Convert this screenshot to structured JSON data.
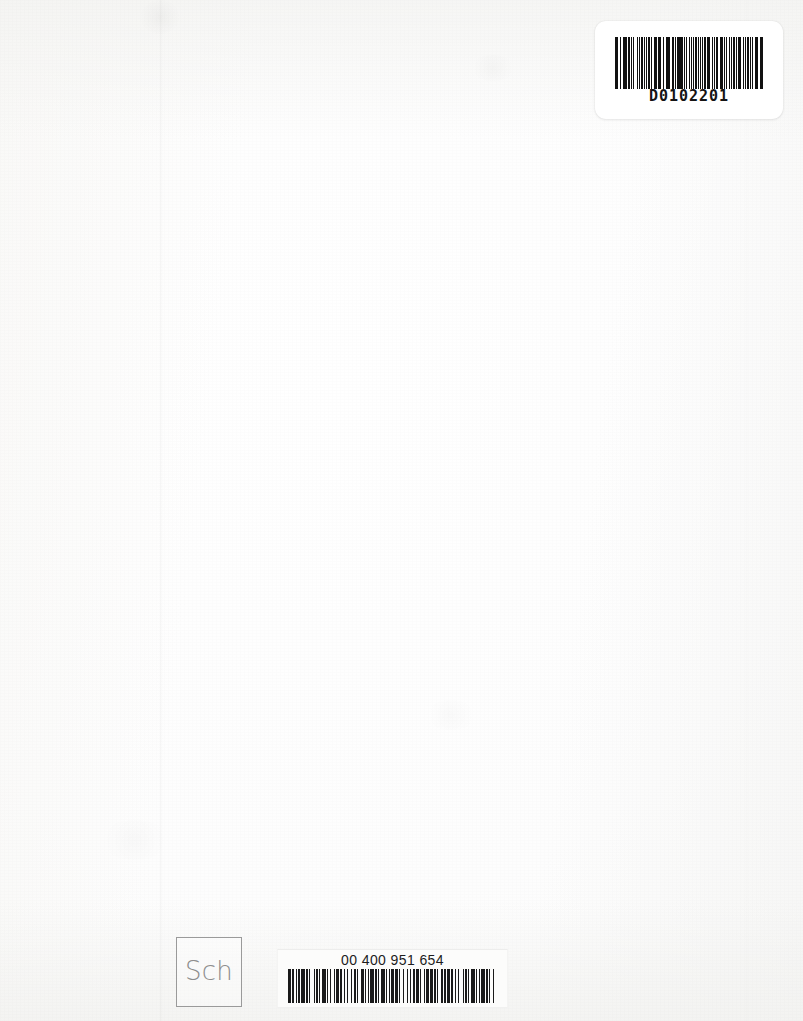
{
  "page": {
    "kind": "scanned-book-page",
    "width": 803,
    "height": 1021,
    "background_color": "#fdfdfc",
    "paper_tone": "#fafaf9"
  },
  "top_label": {
    "name": "accession-barcode-label",
    "code_text": "D0102201",
    "symbology": "code-39",
    "label_color": "#ffffff",
    "ink_color": "#111111",
    "bar_widths": [
      2,
      1,
      1,
      2,
      1,
      3,
      1,
      1,
      2,
      1,
      1,
      1,
      3,
      1,
      2,
      1,
      1,
      4,
      1,
      2,
      1,
      1,
      3,
      2,
      1,
      1,
      2,
      1,
      3,
      1,
      1,
      2,
      1,
      1,
      3,
      1,
      2,
      1,
      1,
      2,
      1,
      3,
      1,
      1,
      2,
      1,
      1,
      3,
      2,
      1,
      1,
      2,
      1,
      1,
      3,
      1,
      2,
      1,
      1,
      2,
      1,
      3,
      1,
      1,
      2,
      1,
      2,
      1,
      3,
      1,
      1,
      2,
      1,
      1,
      2,
      1,
      3,
      1,
      2,
      1,
      1,
      3,
      1,
      1,
      2,
      1,
      2,
      3,
      1,
      1,
      2,
      1,
      1,
      2,
      1,
      3,
      1,
      2,
      1,
      1,
      3,
      1,
      1,
      2,
      2,
      1,
      1,
      3,
      1,
      1,
      2,
      1,
      3,
      1,
      1,
      2,
      1,
      2,
      1,
      1,
      3,
      2,
      1,
      1,
      2
    ]
  },
  "bottom_label": {
    "name": "library-barcode-label",
    "code_text": "00 400 951 654",
    "symbology": "code-39",
    "label_color": "#fcfcfb",
    "ink_color": "#1a1a1a",
    "bar_widths": [
      3,
      1,
      1,
      2,
      1,
      1,
      2,
      1,
      3,
      1,
      2,
      1,
      1,
      3,
      1,
      1,
      2,
      1,
      1,
      2,
      3,
      1,
      1,
      2,
      1,
      2,
      1,
      1,
      3,
      1,
      2,
      1,
      1,
      2,
      1,
      3,
      1,
      1,
      2,
      1,
      1,
      3,
      2,
      1,
      1,
      2,
      1,
      1,
      3,
      1,
      2,
      1,
      1,
      2,
      3,
      1,
      1,
      2,
      1,
      1,
      2,
      1,
      3,
      1,
      1,
      2,
      1,
      3,
      1,
      2,
      1,
      1,
      2,
      1,
      3,
      1,
      1,
      2,
      1,
      1,
      3,
      1,
      2,
      1,
      2,
      1,
      1,
      3,
      1,
      1,
      2,
      1,
      3,
      1,
      1,
      2,
      1,
      2,
      1,
      3,
      1,
      1,
      2,
      1,
      1,
      2,
      3,
      1,
      1,
      2,
      1,
      1,
      3,
      1,
      2,
      1,
      1,
      2,
      1,
      3
    ]
  },
  "stamp": {
    "name": "sch-library-stamp",
    "text": "Sch",
    "border_color": "#9a9a9a",
    "text_color": "#8d8d8d"
  },
  "marks": {
    "crease_label": "vertical fold crease",
    "smudge_label": "paper smudge"
  }
}
